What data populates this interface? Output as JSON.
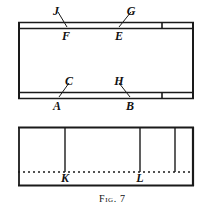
{
  "figure": {
    "caption_prefix": "Fig.",
    "caption_number": "7",
    "top_panel": {
      "name": "upper-board-diagram",
      "labels_above_top_band": [
        {
          "text": "J",
          "x": 56,
          "y": 6
        },
        {
          "text": "G",
          "x": 131,
          "y": 6
        }
      ],
      "labels_below_top_band": [
        {
          "text": "F",
          "x": 63,
          "y": 31
        },
        {
          "text": "E",
          "x": 120,
          "y": 31
        }
      ],
      "labels_above_bottom_band": [
        {
          "text": "C",
          "x": 70,
          "y": 76
        },
        {
          "text": "H",
          "x": 117,
          "y": 76
        }
      ],
      "labels_below_bottom_band": [
        {
          "text": "A",
          "x": 56,
          "y": 101
        },
        {
          "text": "B",
          "x": 131,
          "y": 101
        }
      ]
    },
    "bottom_panel": {
      "name": "lower-board-diagram",
      "labels_below_dotted": [
        {
          "text": "K",
          "x": 65,
          "y": 178
        },
        {
          "text": "L",
          "x": 140,
          "y": 178
        }
      ]
    },
    "colors": {
      "ink": "#1a1a1a",
      "paper": "#ffffff"
    }
  }
}
